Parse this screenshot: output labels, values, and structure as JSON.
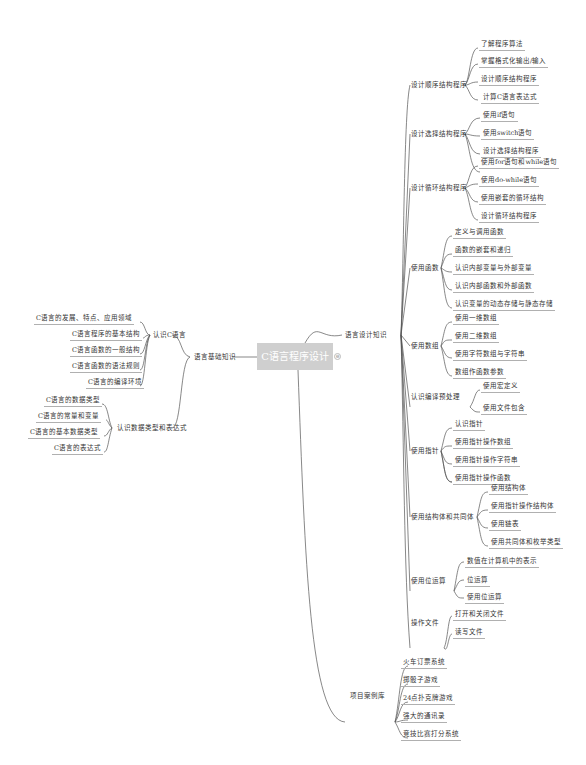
{
  "central": {
    "label": "C语言程序设计"
  },
  "left": {
    "label": "语言基础知识",
    "children": [
      {
        "label": "认识C语言",
        "children": [
          "C语言的发展、特点、应用领域",
          "C语言程序的基本结构",
          "C语言函数的一般结构",
          "C语言函数的语法规则",
          "C语言的编译环境"
        ]
      },
      {
        "label": "认识数据类型和表达式",
        "children": [
          "C语言的数据类型",
          "C语言的常量和变量",
          "C语言的基本数据类型",
          "C语言的表达式"
        ]
      }
    ]
  },
  "right": [
    {
      "label": "语言设计知识",
      "children": [
        {
          "label": "设计顺序结构程序",
          "children": [
            "了解程序算法",
            "掌握格式化输出/输入",
            "设计顺序结构程序"
          ]
        },
        {
          "label": "设计选择结构程序",
          "children": [
            "计算C语言表达式",
            "使用if语句",
            "使用switch语句",
            "设计选择结构程序"
          ]
        },
        {
          "label": "设计循环结构程序",
          "children": [
            "使用for语句和while语句",
            "使用do-while语句",
            "使用嵌套的循环结构",
            "设计循环结构程序"
          ]
        },
        {
          "label": "使用函数",
          "children": [
            "定义与调用函数",
            "函数的嵌套和递归",
            "认识内部变量与外部变量",
            "认识内部函数和外部函数",
            "认识变量的动态存储与静态存储"
          ]
        },
        {
          "label": "使用数组",
          "children": [
            "使用一维数组",
            "使用二维数组",
            "使用字符数组与字符串",
            "数组作函数参数"
          ]
        },
        {
          "label": "认识编译预处理",
          "children": [
            "使用宏定义",
            "使用文件包含"
          ]
        },
        {
          "label": "使用指针",
          "children": [
            "认识指针",
            "使用指针操作数组",
            "使用指针操作字符串",
            "使用指针操作函数"
          ]
        },
        {
          "label": "使用结构体和共同体",
          "children": [
            "使用结构体",
            "使用指针操作结构体",
            "使用链表",
            "使用共同体和枚举类型"
          ]
        },
        {
          "label": "使用位运算",
          "children": [
            "数值在计算机中的表示",
            "位运算",
            "使用位运算"
          ]
        },
        {
          "label": "操作文件",
          "children": [
            "打开和关闭文件",
            "读写文件"
          ]
        }
      ]
    },
    {
      "label": "项目案例库",
      "children": [
        "火车订票系统",
        "掷骰子游戏",
        "24点扑克牌游戏",
        "强大的通讯录",
        "竞技比赛打分系统"
      ]
    }
  ],
  "toggle_icon": "⊖"
}
